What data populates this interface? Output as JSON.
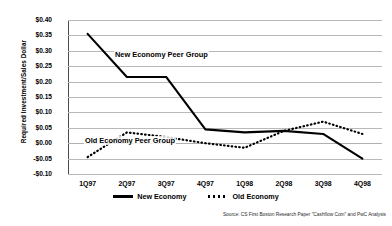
{
  "chart_data": {
    "type": "line",
    "title": "",
    "xlabel": "",
    "ylabel": "Required Investment/Sales Dollar",
    "categories": [
      "1Q97",
      "2Q97",
      "3Q97",
      "4Q97",
      "1Q98",
      "2Q98",
      "3Q98",
      "4Q98"
    ],
    "ylim": [
      -0.1,
      0.4
    ],
    "ytick_labels": [
      "$0.40",
      "$0.35",
      "$0.30",
      "$0.25",
      "$0.20",
      "$0.15",
      "$0.10",
      "$0.05",
      "$0.00",
      "-$0.05",
      "-$0.10"
    ],
    "ytick_values": [
      0.4,
      0.35,
      0.3,
      0.25,
      0.2,
      0.15,
      0.1,
      0.05,
      0.0,
      -0.05,
      -0.1
    ],
    "grid": true,
    "legend_position": "bottom",
    "series": [
      {
        "name": "New Economy",
        "style": "solid",
        "color": "#000000",
        "values": [
          0.355,
          0.215,
          0.215,
          0.045,
          0.035,
          0.04,
          0.03,
          -0.05
        ]
      },
      {
        "name": "Old Economy",
        "style": "dotted",
        "color": "#000000",
        "values": [
          -0.045,
          0.035,
          0.02,
          0.0,
          -0.015,
          0.04,
          0.07,
          0.03
        ]
      }
    ],
    "annotations": [
      {
        "text": "New Economy Peer Group",
        "series": "New Economy"
      },
      {
        "text": "Old Economy Peer Group",
        "series": "Old Economy"
      }
    ],
    "source": "Source: CS First Boston Research Paper \"Cashflow Com\" and PwC Analysis"
  },
  "legend": {
    "items": [
      {
        "label": "New Economy"
      },
      {
        "label": "Old Economy"
      }
    ]
  }
}
